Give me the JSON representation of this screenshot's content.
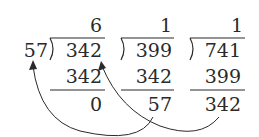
{
  "divisor_outer": "57",
  "divisions": [
    {
      "quotient": "6",
      "dividend": "342",
      "product": "342",
      "remainder": "0"
    },
    {
      "quotient": "1",
      "dividend": "399",
      "product": "342",
      "remainder": "57"
    },
    {
      "quotient": "1",
      "dividend": "741",
      "product": "399",
      "remainder": "342"
    }
  ],
  "arrows": [
    {
      "from": "remainder 57 (division 2)",
      "to": "divisor 57"
    },
    {
      "from": "remainder 342 (division 3)",
      "to": "dividend 342 (division 1)"
    }
  ],
  "colors": {
    "ink": "#2a2a2a",
    "background": "#ffffff"
  }
}
